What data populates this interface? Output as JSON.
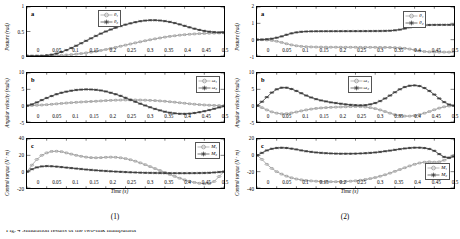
{
  "page": {
    "caption_cut": "Fig. 4  Simulation results of the two-link manipulator"
  },
  "axis": {
    "xlabel": "Time (s)",
    "xticks": [
      "0",
      "0.05",
      "0.1",
      "0.15",
      "0.2",
      "0.25",
      "0.3",
      "0.35",
      "0.4",
      "0.45",
      "0.5"
    ],
    "ylabel_posture": "Posture (rad)",
    "ylabel_velocity": "Angular velocity (rad/s)",
    "ylabel_torque": "Control torque (N · m)"
  },
  "series_names": {
    "theta1": "θ₁",
    "theta2": "θ₂",
    "omega1": "ω₁",
    "omega2": "ω₂",
    "m1": "M₁",
    "m2": "M₂"
  },
  "colors": {
    "series1": "#9a9a9a",
    "series2": "#3a3a3a",
    "axis": "#000000",
    "legend_border": "#555555"
  },
  "figures": [
    {
      "id": "fig1",
      "subcaption": "(1)",
      "panels": [
        {
          "letter": "a",
          "ylabel_key": "ylabel_posture",
          "yticks": [
            "0",
            "0.5",
            "1"
          ]
        },
        {
          "letter": "b",
          "ylabel_key": "ylabel_velocity",
          "yticks": [
            "-5",
            "0",
            "5",
            "10"
          ]
        },
        {
          "letter": "c",
          "ylabel_key": "ylabel_torque",
          "yticks": [
            "-20",
            "0",
            "20",
            "40"
          ]
        }
      ]
    },
    {
      "id": "fig2",
      "subcaption": "(2)",
      "panels": [
        {
          "letter": "a",
          "ylabel_key": "ylabel_posture",
          "yticks": [
            "-1",
            "0",
            "1",
            "2"
          ]
        },
        {
          "letter": "b",
          "ylabel_key": "ylabel_velocity",
          "yticks": [
            "-5",
            "0",
            "5",
            "10"
          ]
        },
        {
          "letter": "c",
          "ylabel_key": "ylabel_torque",
          "yticks": [
            "-40",
            "-20",
            "0",
            "20"
          ]
        }
      ]
    }
  ],
  "chart_data": [
    {
      "type": "line",
      "title": "(1) a",
      "xlabel": "Time (s)",
      "ylabel": "Posture (rad)",
      "xlim": [
        0,
        0.5
      ],
      "ylim": [
        0,
        1
      ],
      "grid": false,
      "legend_position": "upper-left-inside",
      "x": [
        0,
        0.0125,
        0.025,
        0.0375,
        0.05,
        0.0625,
        0.075,
        0.0875,
        0.1,
        0.1125,
        0.125,
        0.1375,
        0.15,
        0.1625,
        0.175,
        0.1875,
        0.2,
        0.2125,
        0.225,
        0.2375,
        0.25,
        0.2625,
        0.275,
        0.2875,
        0.3,
        0.3125,
        0.325,
        0.3375,
        0.35,
        0.3625,
        0.375,
        0.3875,
        0.4,
        0.4125,
        0.425,
        0.4375,
        0.45,
        0.4625,
        0.475,
        0.4875,
        0.5
      ],
      "series": [
        {
          "name": "θ₁",
          "values": [
            0,
            0,
            0,
            0,
            0.002,
            0.004,
            0.008,
            0.013,
            0.02,
            0.028,
            0.038,
            0.05,
            0.063,
            0.078,
            0.095,
            0.113,
            0.133,
            0.154,
            0.176,
            0.199,
            0.222,
            0.245,
            0.268,
            0.29,
            0.311,
            0.331,
            0.35,
            0.368,
            0.385,
            0.4,
            0.413,
            0.425,
            0.435,
            0.443,
            0.45,
            0.456,
            0.46,
            0.464,
            0.467,
            0.47,
            0.472
          ]
        },
        {
          "name": "θ₂",
          "values": [
            0,
            0,
            0.001,
            0.004,
            0.012,
            0.027,
            0.05,
            0.082,
            0.12,
            0.163,
            0.21,
            0.26,
            0.31,
            0.36,
            0.41,
            0.457,
            0.5,
            0.54,
            0.577,
            0.61,
            0.64,
            0.666,
            0.69,
            0.71,
            0.723,
            0.73,
            0.73,
            0.724,
            0.712,
            0.695,
            0.672,
            0.645,
            0.615,
            0.585,
            0.557,
            0.532,
            0.512,
            0.497,
            0.487,
            0.481,
            0.478
          ]
        }
      ]
    },
    {
      "type": "line",
      "title": "(1) b",
      "xlabel": "Time (s)",
      "ylabel": "Angular velocity (rad/s)",
      "xlim": [
        0,
        0.5
      ],
      "ylim": [
        -5,
        10
      ],
      "grid": false,
      "legend_position": "upper-right-inside",
      "x": [
        0,
        0.0125,
        0.025,
        0.0375,
        0.05,
        0.0625,
        0.075,
        0.0875,
        0.1,
        0.1125,
        0.125,
        0.1375,
        0.15,
        0.1625,
        0.175,
        0.1875,
        0.2,
        0.2125,
        0.225,
        0.2375,
        0.25,
        0.2625,
        0.275,
        0.2875,
        0.3,
        0.3125,
        0.325,
        0.3375,
        0.35,
        0.3625,
        0.375,
        0.3875,
        0.4,
        0.4125,
        0.425,
        0.4375,
        0.45,
        0.4625,
        0.475,
        0.4875,
        0.5
      ],
      "series": [
        {
          "name": "ω₁",
          "values": [
            0,
            0.05,
            0.12,
            0.2,
            0.3,
            0.42,
            0.55,
            0.68,
            0.8,
            0.92,
            1.02,
            1.12,
            1.2,
            1.28,
            1.35,
            1.45,
            1.55,
            1.62,
            1.68,
            1.72,
            1.74,
            1.75,
            1.74,
            1.72,
            1.68,
            1.62,
            1.55,
            1.45,
            1.34,
            1.2,
            1.06,
            0.9,
            0.74,
            0.58,
            0.44,
            0.32,
            0.22,
            0.14,
            0.08,
            0.04,
            0.02
          ]
        },
        {
          "name": "ω₂",
          "values": [
            0,
            0.4,
            1.0,
            1.7,
            2.35,
            2.95,
            3.5,
            3.95,
            4.3,
            4.58,
            4.8,
            4.92,
            4.98,
            4.95,
            4.85,
            4.65,
            4.35,
            3.95,
            3.5,
            3.0,
            2.4,
            1.8,
            1.2,
            0.6,
            0.05,
            -0.5,
            -1.0,
            -1.45,
            -1.85,
            -2.15,
            -2.35,
            -2.48,
            -2.5,
            -2.42,
            -2.25,
            -2.0,
            -1.7,
            -1.35,
            -0.95,
            -0.55,
            -0.2
          ]
        }
      ]
    },
    {
      "type": "line",
      "title": "(1) c",
      "xlabel": "Time (s)",
      "ylabel": "Control torque (N · m)",
      "xlim": [
        0,
        0.5
      ],
      "ylim": [
        -20,
        40
      ],
      "grid": false,
      "legend_position": "upper-right-inside",
      "x": [
        0,
        0.0125,
        0.025,
        0.0375,
        0.05,
        0.0625,
        0.075,
        0.0875,
        0.1,
        0.1125,
        0.125,
        0.1375,
        0.15,
        0.1625,
        0.175,
        0.1875,
        0.2,
        0.2125,
        0.225,
        0.2375,
        0.25,
        0.2625,
        0.275,
        0.2875,
        0.3,
        0.3125,
        0.325,
        0.3375,
        0.35,
        0.3625,
        0.375,
        0.3875,
        0.4,
        0.4125,
        0.425,
        0.4375,
        0.45,
        0.4625,
        0.475,
        0.4875,
        0.5
      ],
      "series": [
        {
          "name": "M₁",
          "values": [
            0,
            8,
            15,
            20,
            23,
            24.8,
            25,
            24.5,
            23,
            21.5,
            20,
            18.8,
            17.8,
            17.2,
            17,
            17.2,
            17.6,
            17.8,
            17.6,
            17,
            16,
            14.6,
            12.8,
            10.8,
            8.6,
            6.2,
            3.8,
            1.4,
            -1,
            -3.4,
            -5.8,
            -8,
            -10,
            -11.8,
            -13.2,
            -14.2,
            -14.8,
            -14.6,
            -12,
            -6,
            0
          ]
        },
        {
          "name": "M₂",
          "values": [
            0,
            3,
            5.2,
            6.4,
            6.8,
            6.6,
            6.2,
            5.6,
            5,
            4.4,
            3.8,
            3.2,
            2.6,
            2.1,
            1.6,
            1.2,
            0.8,
            0.4,
            0.1,
            -0.2,
            -0.5,
            -0.8,
            -1,
            -1.2,
            -1.4,
            -1.5,
            -1.6,
            -1.7,
            -1.8,
            -1.85,
            -1.9,
            -1.9,
            -1.9,
            -1.85,
            -1.8,
            -1.7,
            -1.6,
            -1.4,
            -1,
            -0.5,
            0
          ]
        }
      ]
    },
    {
      "type": "line",
      "title": "(2) a",
      "xlabel": "Time (s)",
      "ylabel": "Posture (rad)",
      "xlim": [
        0,
        0.5
      ],
      "ylim": [
        -1,
        2
      ],
      "grid": false,
      "legend_position": "upper-right-inside",
      "x": [
        0,
        0.0125,
        0.025,
        0.0375,
        0.05,
        0.0625,
        0.075,
        0.0875,
        0.1,
        0.1125,
        0.125,
        0.1375,
        0.15,
        0.1625,
        0.175,
        0.1875,
        0.2,
        0.2125,
        0.225,
        0.2375,
        0.25,
        0.2625,
        0.275,
        0.2875,
        0.3,
        0.3125,
        0.325,
        0.3375,
        0.35,
        0.3625,
        0.375,
        0.3875,
        0.4,
        0.4125,
        0.425,
        0.4375,
        0.45,
        0.4625,
        0.475,
        0.4875,
        0.5
      ],
      "series": [
        {
          "name": "θ₁",
          "values": [
            0,
            -0.005,
            -0.02,
            -0.05,
            -0.1,
            -0.17,
            -0.25,
            -0.32,
            -0.375,
            -0.41,
            -0.432,
            -0.445,
            -0.452,
            -0.456,
            -0.459,
            -0.461,
            -0.462,
            -0.463,
            -0.464,
            -0.465,
            -0.466,
            -0.467,
            -0.468,
            -0.469,
            -0.47,
            -0.471,
            -0.473,
            -0.477,
            -0.485,
            -0.5,
            -0.53,
            -0.575,
            -0.63,
            -0.685,
            -0.725,
            -0.748,
            -0.757,
            -0.76,
            -0.761,
            -0.762,
            -0.762
          ]
        },
        {
          "name": "θ₂",
          "values": [
            0,
            0.006,
            0.025,
            0.06,
            0.12,
            0.2,
            0.3,
            0.385,
            0.445,
            0.482,
            0.5,
            0.508,
            0.512,
            0.514,
            0.515,
            0.516,
            0.517,
            0.518,
            0.519,
            0.52,
            0.521,
            0.522,
            0.523,
            0.525,
            0.527,
            0.53,
            0.536,
            0.548,
            0.572,
            0.615,
            0.68,
            0.755,
            0.82,
            0.865,
            0.89,
            0.9,
            0.905,
            0.907,
            0.908,
            0.909,
            0.909
          ]
        }
      ]
    },
    {
      "type": "line",
      "title": "(2) b",
      "xlabel": "Time (s)",
      "ylabel": "Angular velocity (rad/s)",
      "xlim": [
        0,
        0.5
      ],
      "ylim": [
        -5,
        10
      ],
      "grid": false,
      "legend_position": "upper-right-inside",
      "x": [
        0,
        0.0125,
        0.025,
        0.0375,
        0.05,
        0.0625,
        0.075,
        0.0875,
        0.1,
        0.1125,
        0.125,
        0.1375,
        0.15,
        0.1625,
        0.175,
        0.1875,
        0.2,
        0.2125,
        0.225,
        0.2375,
        0.25,
        0.2625,
        0.275,
        0.2875,
        0.3,
        0.3125,
        0.325,
        0.3375,
        0.35,
        0.3625,
        0.375,
        0.3875,
        0.4,
        0.4125,
        0.425,
        0.4375,
        0.45,
        0.4625,
        0.475,
        0.4875,
        0.5
      ],
      "series": [
        {
          "name": "ω₁",
          "values": [
            0,
            -0.6,
            -1.3,
            -1.9,
            -2.3,
            -2.5,
            -2.45,
            -2.25,
            -1.95,
            -1.6,
            -1.3,
            -1.05,
            -0.85,
            -0.7,
            -0.6,
            -0.52,
            -0.45,
            -0.4,
            -0.35,
            -0.3,
            -0.28,
            -0.3,
            -0.4,
            -0.6,
            -0.9,
            -1.3,
            -1.8,
            -2.3,
            -2.75,
            -3.05,
            -3.2,
            -3.2,
            -3.05,
            -2.75,
            -2.3,
            -1.8,
            -1.25,
            -0.75,
            -0.35,
            -0.1,
            0
          ]
        },
        {
          "name": "ω₂",
          "values": [
            0,
            1.2,
            2.6,
            4.0,
            5.0,
            5.5,
            5.5,
            5.1,
            4.5,
            3.8,
            3.1,
            2.5,
            2.0,
            1.6,
            1.3,
            1.0,
            0.8,
            0.6,
            0.4,
            0.25,
            0.15,
            0.1,
            0.15,
            0.4,
            0.8,
            1.4,
            2.2,
            3.1,
            4.1,
            5.0,
            5.7,
            6.1,
            6.2,
            6.0,
            5.4,
            4.5,
            3.4,
            2.2,
            1.1,
            0.35,
            0
          ]
        }
      ]
    },
    {
      "type": "line",
      "title": "(2) c",
      "xlabel": "Time (s)",
      "ylabel": "Control torque (N · m)",
      "xlim": [
        0,
        0.5
      ],
      "ylim": [
        -40,
        20
      ],
      "grid": false,
      "legend_position": "lower-right-inside",
      "x": [
        0,
        0.0125,
        0.025,
        0.0375,
        0.05,
        0.0625,
        0.075,
        0.0875,
        0.1,
        0.1125,
        0.125,
        0.1375,
        0.15,
        0.1625,
        0.175,
        0.1875,
        0.2,
        0.2125,
        0.225,
        0.2375,
        0.25,
        0.2625,
        0.275,
        0.2875,
        0.3,
        0.3125,
        0.325,
        0.3375,
        0.35,
        0.3625,
        0.375,
        0.3875,
        0.4,
        0.4125,
        0.425,
        0.4375,
        0.45,
        0.4625,
        0.475,
        0.4875,
        0.5
      ],
      "series": [
        {
          "name": "M₁",
          "values": [
            0,
            -5,
            -11,
            -16,
            -20,
            -23,
            -25.5,
            -27.5,
            -29,
            -30,
            -30.8,
            -31.3,
            -31.7,
            -32,
            -32.2,
            -32.3,
            -32.3,
            -32.2,
            -32,
            -31.7,
            -31.2,
            -30.5,
            -29.6,
            -28.5,
            -27.2,
            -25.6,
            -23.8,
            -21.8,
            -19.6,
            -17.4,
            -15.2,
            -13,
            -11,
            -9.4,
            -8.4,
            -8,
            -8.4,
            -8,
            -6,
            -3,
            0
          ]
        },
        {
          "name": "M₂",
          "values": [
            0,
            3,
            6,
            8,
            9,
            9.3,
            9,
            8.2,
            7.2,
            6,
            5,
            4.2,
            3.5,
            3,
            2.6,
            2.3,
            2.1,
            2,
            2,
            2,
            2.1,
            2.3,
            2.6,
            3,
            3.5,
            4.2,
            5,
            5.8,
            6.7,
            7.6,
            8.4,
            9,
            9.4,
            9.4,
            8.9,
            7.8,
            5.5,
            1.5,
            -2,
            -3,
            -1.5
          ]
        }
      ]
    }
  ]
}
